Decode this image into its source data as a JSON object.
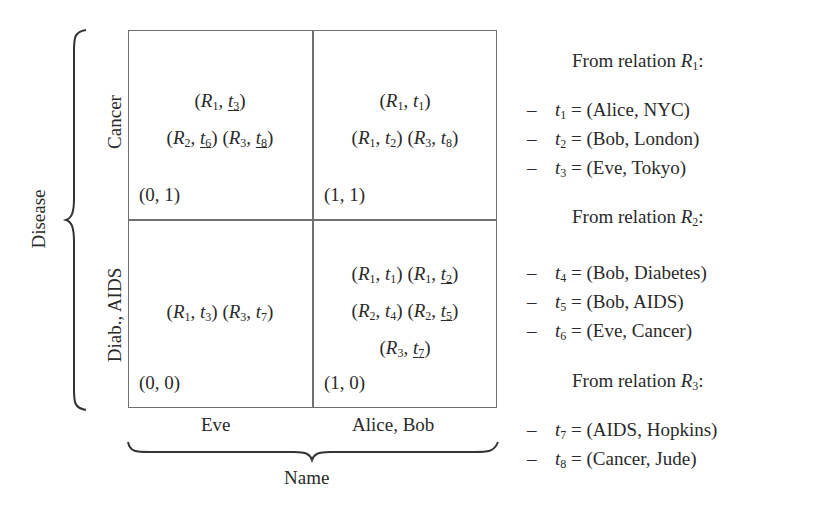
{
  "axes": {
    "y_label": "Disease",
    "y_categories": [
      "Cancer",
      "Diab., AIDS"
    ],
    "x_label": "Name",
    "x_categories": [
      "Eve",
      "Alice, Bob"
    ]
  },
  "cells": {
    "top_left": {
      "coord": "(0, 1)",
      "entries": [
        {
          "rel": "R",
          "rel_sub": "1",
          "t": "t",
          "t_sub": "3",
          "underlined": true
        },
        {
          "rel": "R",
          "rel_sub": "2",
          "t": "t",
          "t_sub": "6",
          "underlined": true
        },
        {
          "rel": "R",
          "rel_sub": "3",
          "t": "t",
          "t_sub": "8",
          "underlined": true
        }
      ]
    },
    "top_right": {
      "coord": "(1, 1)",
      "entries": [
        {
          "rel": "R",
          "rel_sub": "1",
          "t": "t",
          "t_sub": "1",
          "underlined": false
        },
        {
          "rel": "R",
          "rel_sub": "1",
          "t": "t",
          "t_sub": "2",
          "underlined": false
        },
        {
          "rel": "R",
          "rel_sub": "3",
          "t": "t",
          "t_sub": "8",
          "underlined": false
        }
      ]
    },
    "bottom_left": {
      "coord": "(0, 0)",
      "entries": [
        {
          "rel": "R",
          "rel_sub": "1",
          "t": "t",
          "t_sub": "3",
          "underlined": false
        },
        {
          "rel": "R",
          "rel_sub": "3",
          "t": "t",
          "t_sub": "7",
          "underlined": false
        }
      ]
    },
    "bottom_right": {
      "coord": "(1, 0)",
      "entries": [
        {
          "rel": "R",
          "rel_sub": "1",
          "t": "t",
          "t_sub": "1",
          "underlined": false
        },
        {
          "rel": "R",
          "rel_sub": "1",
          "t": "t",
          "t_sub": "2",
          "underlined": true
        },
        {
          "rel": "R",
          "rel_sub": "2",
          "t": "t",
          "t_sub": "4",
          "underlined": false
        },
        {
          "rel": "R",
          "rel_sub": "2",
          "t": "t",
          "t_sub": "5",
          "underlined": true
        },
        {
          "rel": "R",
          "rel_sub": "3",
          "t": "t",
          "t_sub": "7",
          "underlined": true
        }
      ]
    }
  },
  "relations": [
    {
      "header": "From relation ",
      "name": "R",
      "sub": "1",
      "tuples": [
        {
          "t": "t",
          "sub": "1",
          "value": "= (Alice, NYC)"
        },
        {
          "t": "t",
          "sub": "2",
          "value": "= (Bob, London)"
        },
        {
          "t": "t",
          "sub": "3",
          "value": "= (Eve, Tokyo)"
        }
      ]
    },
    {
      "header": "From relation ",
      "name": "R",
      "sub": "2",
      "tuples": [
        {
          "t": "t",
          "sub": "4",
          "value": "= (Bob, Diabetes)"
        },
        {
          "t": "t",
          "sub": "5",
          "value": "= (Bob, AIDS)"
        },
        {
          "t": "t",
          "sub": "6",
          "value": "= (Eve, Cancer)"
        }
      ]
    },
    {
      "header": "From relation ",
      "name": "R",
      "sub": "3",
      "tuples": [
        {
          "t": "t",
          "sub": "7",
          "value": "= (AIDS, Hopkins)"
        },
        {
          "t": "t",
          "sub": "8",
          "value": "= (Cancer, Jude)"
        }
      ]
    }
  ],
  "symbols": {
    "dash": "–",
    "open": "(",
    "close": ")",
    "comma": ", ",
    "colon": ":"
  }
}
